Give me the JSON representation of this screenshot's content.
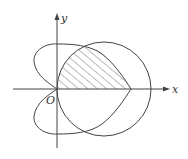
{
  "diagram": {
    "type": "polar-region",
    "labels": {
      "x_axis": "x",
      "y_axis": "y",
      "origin": "O"
    },
    "curves": [
      {
        "name": "circle",
        "description": "circle through the origin, centered on the positive x-axis"
      },
      {
        "name": "heart-curve",
        "description": "heart-shaped closed curve through origin, lobes on left, pointed tip on positive x-axis"
      }
    ],
    "shaded_region": "region above x-axis, inside the heart curve and inside the circle (hatched)",
    "colors": {
      "stroke": "#444444",
      "hatch": "#555555",
      "background": "#ffffff"
    }
  }
}
